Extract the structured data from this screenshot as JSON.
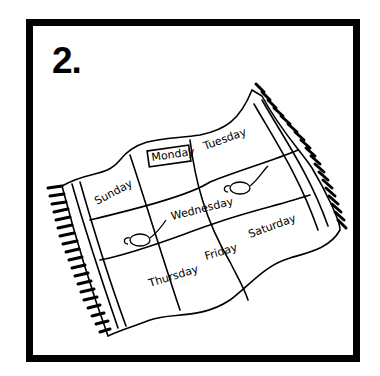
{
  "worksheet": {
    "number_label": "2.",
    "illustration": "magic-carpet",
    "days": {
      "sunday": "Sunday",
      "monday": "Monday",
      "tuesday": "Tuesday",
      "wednesday": "Wednesday",
      "thursday": "Thursday",
      "friday": "Friday",
      "saturday": "Saturday"
    },
    "highlighted_day": "Monday",
    "decorations": [
      "magic-lamp",
      "magic-lamp"
    ]
  },
  "colors": {
    "ink": "#000000",
    "paper": "#ffffff"
  }
}
